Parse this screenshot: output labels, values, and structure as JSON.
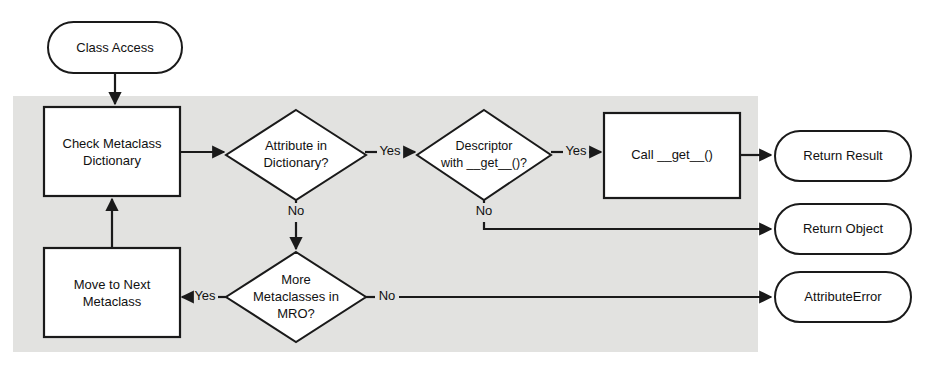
{
  "diagram": {
    "background_color": "#e2e2e0",
    "line_color": "#1a1a1a",
    "node_fill": "#ffffff",
    "nodes": [
      {
        "id": "class_access",
        "label": "Class Access",
        "shape": "terminator"
      },
      {
        "id": "check_dict",
        "label_line1": "Check Metaclass",
        "label_line2": "Dictionary",
        "shape": "process"
      },
      {
        "id": "attr_in_dict",
        "label_line1": "Attribute in",
        "label_line2": "Dictionary?",
        "shape": "decision"
      },
      {
        "id": "descriptor",
        "label_line1": "Descriptor",
        "label_line2": "with __get__()?",
        "shape": "decision"
      },
      {
        "id": "call_get",
        "label": "Call __get__()",
        "shape": "process"
      },
      {
        "id": "return_result",
        "label": "Return Result",
        "shape": "terminator"
      },
      {
        "id": "return_object",
        "label": "Return Object",
        "shape": "terminator"
      },
      {
        "id": "attribute_error",
        "label": "AttributeError",
        "shape": "terminator"
      },
      {
        "id": "more_metaclasses",
        "label_line1": "More",
        "label_line2": "Metaclasses in",
        "label_line3": "MRO?",
        "shape": "decision"
      },
      {
        "id": "move_next",
        "label_line1": "Move to Next",
        "label_line2": "Metaclass",
        "shape": "process"
      }
    ],
    "edges": [
      {
        "id": "e1",
        "from": "class_access",
        "to": "check_dict",
        "label": ""
      },
      {
        "id": "e2",
        "from": "check_dict",
        "to": "attr_in_dict",
        "label": ""
      },
      {
        "id": "e3",
        "from": "attr_in_dict",
        "to": "descriptor",
        "label": "Yes"
      },
      {
        "id": "e4",
        "from": "attr_in_dict",
        "to": "more_metaclasses",
        "label": "No"
      },
      {
        "id": "e5",
        "from": "descriptor",
        "to": "call_get",
        "label": "Yes"
      },
      {
        "id": "e6",
        "from": "descriptor",
        "to": "return_object",
        "label": "No"
      },
      {
        "id": "e7",
        "from": "call_get",
        "to": "return_result",
        "label": ""
      },
      {
        "id": "e8",
        "from": "more_metaclasses",
        "to": "move_next",
        "label": "Yes"
      },
      {
        "id": "e9",
        "from": "more_metaclasses",
        "to": "attribute_error",
        "label": "No"
      },
      {
        "id": "e10",
        "from": "move_next",
        "to": "check_dict",
        "label": ""
      }
    ]
  }
}
